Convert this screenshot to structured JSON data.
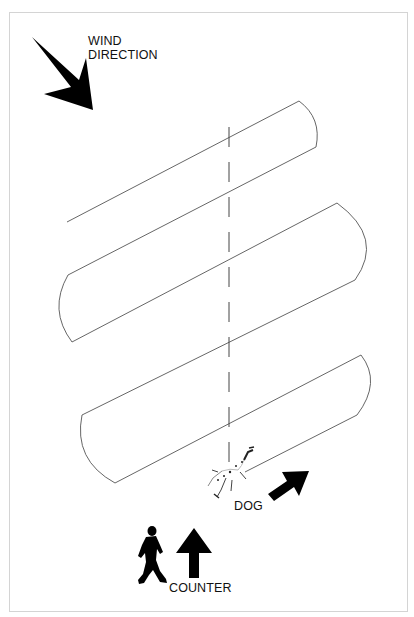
{
  "diagram": {
    "type": "search-pattern",
    "labels": {
      "wind_line1": "WIND",
      "wind_line2": "DIRECTION",
      "dog": "DOG",
      "counter": "COUNTER"
    },
    "icons": {
      "wind_arrow": "arrow-down-right-icon",
      "dog_arrow": "arrow-up-right-icon",
      "counter_arrow": "arrow-up-icon",
      "dog": "dog-icon",
      "person": "walking-person-icon"
    },
    "colors": {
      "line": "#555555",
      "fill": "#000000",
      "frame": "#d4d4d4",
      "background": "#ffffff"
    }
  }
}
